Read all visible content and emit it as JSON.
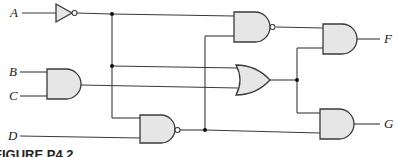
{
  "diagram": {
    "type": "logic-circuit",
    "inputs": [
      "A",
      "B",
      "C",
      "D"
    ],
    "outputs": [
      "F",
      "G"
    ],
    "gates": [
      {
        "id": "inv1",
        "type": "NOT",
        "inputs": [
          "A"
        ],
        "output": "A'"
      },
      {
        "id": "and1",
        "type": "AND",
        "inputs": [
          "B",
          "C"
        ],
        "output": "BC"
      },
      {
        "id": "nand1",
        "type": "NAND",
        "inputs": [
          "A'",
          "nand2"
        ],
        "output": "n1"
      },
      {
        "id": "or1",
        "type": "OR",
        "inputs": [
          "A'",
          "BC"
        ],
        "output": "o1"
      },
      {
        "id": "nand2",
        "type": "NAND",
        "inputs": [
          "A'",
          "D"
        ],
        "output": "n2"
      },
      {
        "id": "andF",
        "type": "AND",
        "inputs": [
          "n1",
          "o1"
        ],
        "output": "F"
      },
      {
        "id": "andG",
        "type": "AND",
        "inputs": [
          "o1",
          "n2"
        ],
        "output": "G"
      }
    ],
    "colors": {
      "gate_fill": "#e6e6e6",
      "wire": "#3a3a3a",
      "junction": "#111111"
    }
  },
  "labels": {
    "A": "A",
    "B": "B",
    "C": "C",
    "D": "D",
    "F": "F",
    "G": "G"
  },
  "caption": "FIGURE P4.2"
}
